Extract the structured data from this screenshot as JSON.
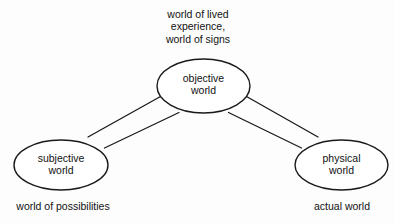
{
  "diagram": {
    "background_color": "#fdfdfd",
    "stroke_color": "#1a1a1a",
    "text_color": "#121212",
    "nodes": [
      {
        "id": "objective",
        "label": "objective\nworld",
        "shape": "ellipse",
        "cx": 203.5,
        "cy": 86,
        "rx": 46.5,
        "ry": 27
      },
      {
        "id": "subjective",
        "label": "subjective\nworld",
        "shape": "ellipse",
        "cx": 61,
        "cy": 165,
        "rx": 47,
        "ry": 25
      },
      {
        "id": "physical",
        "label": "physical\nworld",
        "shape": "ellipse",
        "cx": 341.5,
        "cy": 165,
        "rx": 46.5,
        "ry": 25
      }
    ],
    "edges": [
      {
        "id": "objective-subjective",
        "from": "objective",
        "to": "subjective",
        "style": "double-line-ribbon"
      },
      {
        "id": "objective-physical",
        "from": "objective",
        "to": "physical",
        "style": "double-line-ribbon"
      }
    ],
    "annotations": [
      {
        "id": "top",
        "text": "world of lived\nexperience,\nworld of signs",
        "attached_to": "objective",
        "position": "above"
      },
      {
        "id": "left",
        "text": "world of possibilities",
        "attached_to": "subjective",
        "position": "below"
      },
      {
        "id": "right",
        "text": "actual world",
        "attached_to": "physical",
        "position": "below"
      }
    ]
  }
}
